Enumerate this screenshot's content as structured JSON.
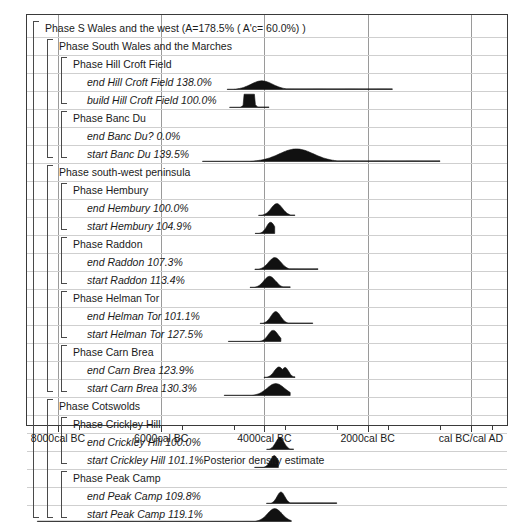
{
  "chart_data": {
    "type": "area",
    "title": "Phase S Wales and the west  (A=178.5% ( A'c= 60.0%) )",
    "xlabel": "Posterior density estimate",
    "ylabel": "",
    "grid": true,
    "legend_position": "none",
    "xlim": [
      -8600,
      700
    ],
    "x_unit": "cal BC/cal AD",
    "tick_labels": [
      "8000cal BC",
      "6000cal BC",
      "4000cal BC",
      "2000cal BC",
      "cal BC/cal AD"
    ],
    "tick_values": [
      -8000,
      -6000,
      -4000,
      -2000,
      0
    ],
    "rows": [
      {
        "id": "phase-s-wales",
        "kind": "phase",
        "depth": 0,
        "label": "Phase S Wales and the west  (A=178.5% ( A'c= 60.0%) )",
        "agreement": "178.5%",
        "aprime_c": "60.0%"
      },
      {
        "id": "phase-south-wales",
        "kind": "phase",
        "depth": 1,
        "label": "Phase South Wales and the Marches"
      },
      {
        "id": "phase-hill-croft-field",
        "kind": "phase",
        "depth": 2,
        "label": "Phase Hill Croft Field"
      },
      {
        "id": "end-hill-croft-field",
        "kind": "param",
        "depth": 3,
        "label": "end Hill Croft Field  138.0%",
        "name": "end Hill Croft Field",
        "agreement": "138.0%",
        "peak_center": -4050,
        "peak_width": 210,
        "tail_to": -1520,
        "tail_level": 0.05,
        "amp": 0.62,
        "bumps": [
          {
            "c": -4180,
            "w": 70,
            "a": 0.45
          }
        ]
      },
      {
        "id": "build-hill-croft-field",
        "kind": "param",
        "depth": 3,
        "label": "build Hill Croft Field  100.0%",
        "name": "build Hill Croft Field",
        "agreement": "100.0%",
        "peak_center": -4290,
        "peak_width": 120,
        "tail_to": -3900,
        "tail_level": 0.04,
        "amp": 0.95,
        "flat": true
      },
      {
        "id": "phase-banc-du",
        "kind": "phase",
        "depth": 2,
        "label": "Phase Banc Du"
      },
      {
        "id": "end-banc-du",
        "kind": "param",
        "depth": 3,
        "label": "end Banc Du?   0.0%",
        "name": "end Banc Du?",
        "agreement": "0.0%",
        "peak_center": null,
        "amp": 0
      },
      {
        "id": "start-banc-du",
        "kind": "param",
        "depth": 3,
        "label": "start Banc Du  139.5%",
        "name": "start Banc Du",
        "agreement": "139.5%",
        "peak_center": -3380,
        "peak_width": 330,
        "tail_to": -600,
        "tail_level": 0.05,
        "amp": 0.9,
        "left_tail_to": -5200
      },
      {
        "id": "phase-sw-peninsula",
        "kind": "phase",
        "depth": 1,
        "label": "Phase south-west peninsula"
      },
      {
        "id": "phase-hembury",
        "kind": "phase",
        "depth": 2,
        "label": "Phase Hembury"
      },
      {
        "id": "end-hembury",
        "kind": "param",
        "depth": 3,
        "label": "end Hembury  100.0%",
        "name": "end Hembury",
        "agreement": "100.0%",
        "peak_center": -3760,
        "peak_width": 110,
        "tail_to": -3400,
        "tail_level": 0.04,
        "amp": 0.85
      },
      {
        "id": "start-hembury",
        "kind": "param",
        "depth": 3,
        "label": "start Hembury  104.9%",
        "name": "start Hembury",
        "agreement": "104.9%",
        "peak_center": -3880,
        "peak_width": 80,
        "tail_to": -3790,
        "tail_level": 0.03,
        "amp": 0.8,
        "left_tail_to": -4180
      },
      {
        "id": "phase-raddon",
        "kind": "phase",
        "depth": 2,
        "label": "Phase Raddon"
      },
      {
        "id": "end-raddon",
        "kind": "param",
        "depth": 3,
        "label": "end Raddon  107.3%",
        "name": "end Raddon",
        "agreement": "107.3%",
        "peak_center": -3800,
        "peak_width": 120,
        "tail_to": -2950,
        "tail_level": 0.06,
        "amp": 0.85
      },
      {
        "id": "start-raddon",
        "kind": "param",
        "depth": 3,
        "label": "start Raddon  113.4%",
        "name": "start Raddon",
        "agreement": "113.4%",
        "peak_center": -3900,
        "peak_width": 110,
        "tail_to": -3500,
        "tail_level": 0.05,
        "amp": 0.8,
        "left_tail_to": -4280,
        "bumps": [
          {
            "c": -3790,
            "w": 55,
            "a": 0.45
          }
        ]
      },
      {
        "id": "phase-helman-tor",
        "kind": "phase",
        "depth": 2,
        "label": "Phase Helman Tor"
      },
      {
        "id": "end-helman-tor",
        "kind": "param",
        "depth": 3,
        "label": "end Helman Tor  101.1%",
        "name": "end Helman Tor",
        "agreement": "101.1%",
        "peak_center": -3780,
        "peak_width": 95,
        "tail_to": -3050,
        "tail_level": 0.04,
        "amp": 0.85
      },
      {
        "id": "start-helman-tor",
        "kind": "param",
        "depth": 3,
        "label": "start Helman Tor  127.5%",
        "name": "start Helman Tor",
        "agreement": "127.5%",
        "peak_center": -3830,
        "peak_width": 95,
        "tail_to": -3680,
        "tail_level": 0.03,
        "amp": 0.8,
        "left_tail_to": -4700
      },
      {
        "id": "phase-carn-brea",
        "kind": "phase",
        "depth": 2,
        "label": "Phase Carn Brea"
      },
      {
        "id": "end-carn-brea",
        "kind": "param",
        "depth": 3,
        "label": "end Carn Brea  123.9%",
        "name": "end Carn Brea",
        "agreement": "123.9%",
        "peak_center": -3720,
        "peak_width": 90,
        "tail_to": -3400,
        "tail_level": 0.05,
        "amp": 0.75,
        "bumps": [
          {
            "c": -3600,
            "w": 70,
            "a": 0.72
          }
        ]
      },
      {
        "id": "start-carn-brea",
        "kind": "param",
        "depth": 3,
        "label": "start Carn Brea  130.3%",
        "name": "start Carn Brea",
        "agreement": "130.3%",
        "peak_center": -3780,
        "peak_width": 170,
        "tail_to": -3500,
        "tail_level": 0.04,
        "amp": 0.85,
        "left_tail_to": -4780
      },
      {
        "id": "phase-cotswolds",
        "kind": "phase",
        "depth": 1,
        "label": "Phase Cotswolds"
      },
      {
        "id": "phase-crickley-hill",
        "kind": "phase",
        "depth": 2,
        "label": "Phase Crickley Hill"
      },
      {
        "id": "end-crickley-hill",
        "kind": "param",
        "depth": 3,
        "label": "end Crickley Hill  100.0%",
        "name": "end Crickley Hill",
        "agreement": "100.0%",
        "peak_center": -3700,
        "peak_width": 80,
        "tail_to": -3430,
        "tail_level": 0.04,
        "amp": 0.85
      },
      {
        "id": "start-crickley-hill",
        "kind": "param",
        "depth": 3,
        "label": "start Crickley Hill  101.1%",
        "name": "start Crickley Hill",
        "agreement": "101.1%",
        "peak_center": -3810,
        "peak_width": 75,
        "tail_to": -3720,
        "tail_level": 0.03,
        "amp": 0.85,
        "left_tail_to": -4190
      },
      {
        "id": "phase-peak-camp",
        "kind": "phase",
        "depth": 2,
        "label": "Phase Peak Camp"
      },
      {
        "id": "end-peak-camp",
        "kind": "param",
        "depth": 3,
        "label": "end Peak Camp  109.8%",
        "name": "end Peak Camp",
        "agreement": "109.8%",
        "peak_center": -3680,
        "peak_width": 75,
        "tail_to": -2600,
        "tail_level": 0.05,
        "amp": 0.82,
        "left_tail_to": -3960
      },
      {
        "id": "start-peak-camp",
        "kind": "param",
        "depth": 3,
        "label": "start Peak Camp  119.1%",
        "name": "start Peak Camp",
        "agreement": "119.1%",
        "peak_center": -3800,
        "peak_width": 140,
        "tail_to": -3480,
        "tail_level": 0.04,
        "amp": 0.92,
        "left_tail_to": -8400
      }
    ],
    "brackets": [
      {
        "id": "bracket-s-wales",
        "depth": 0,
        "from": 0,
        "to": 27
      },
      {
        "id": "bracket-south-wales",
        "depth": 1,
        "from": 1,
        "to": 7
      },
      {
        "id": "bracket-hill-croft-field",
        "depth": 2,
        "from": 2,
        "to": 4
      },
      {
        "id": "bracket-banc-du",
        "depth": 2,
        "from": 5,
        "to": 7
      },
      {
        "id": "bracket-sw-peninsula",
        "depth": 1,
        "from": 8,
        "to": 20
      },
      {
        "id": "bracket-hembury",
        "depth": 2,
        "from": 9,
        "to": 11
      },
      {
        "id": "bracket-raddon",
        "depth": 2,
        "from": 12,
        "to": 14
      },
      {
        "id": "bracket-helman-tor",
        "depth": 2,
        "from": 15,
        "to": 17
      },
      {
        "id": "bracket-carn-brea",
        "depth": 2,
        "from": 18,
        "to": 20
      },
      {
        "id": "bracket-cotswolds",
        "depth": 1,
        "from": 21,
        "to": 27
      },
      {
        "id": "bracket-crickley-hill",
        "depth": 2,
        "from": 22,
        "to": 24
      },
      {
        "id": "bracket-peak-camp",
        "depth": 2,
        "from": 25,
        "to": 27
      }
    ]
  }
}
